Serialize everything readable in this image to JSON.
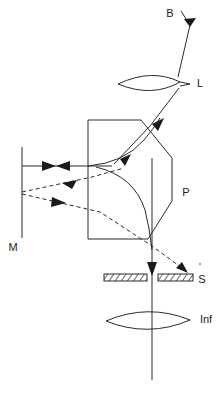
{
  "figure": {
    "type": "optical-ray-diagram",
    "background_color": "#ffffff",
    "line_color": "#2b2b2b",
    "label_color": "#1a1a1a",
    "width": 222,
    "height": 394
  },
  "labels": {
    "beam": "B",
    "lens": "L",
    "prism": "P",
    "mirror": "M",
    "slit": "S",
    "infinity_lens": "Inf"
  },
  "components": [
    {
      "id": "beam-source",
      "label": "B",
      "name": "incident-beam",
      "x": 170,
      "y": 14
    },
    {
      "id": "lens-l",
      "label": "L",
      "name": "collector-lens",
      "x": 200,
      "y": 84
    },
    {
      "id": "prism-p",
      "label": "P",
      "name": "prism",
      "x": 186,
      "y": 193
    },
    {
      "id": "mirror-m",
      "label": "M",
      "name": "mirror",
      "x": 12,
      "y": 248
    },
    {
      "id": "slit-s",
      "label": "S",
      "name": "slit",
      "x": 200,
      "y": 280
    },
    {
      "id": "lens-inf",
      "label": "Inf",
      "name": "infinity-lens",
      "x": 196,
      "y": 320
    }
  ],
  "geometry": {
    "beam_ray": {
      "points": "182,10 188,22 196,42",
      "description": "incident beam B entering from upper right"
    },
    "beam_to_lens": {
      "points": "188,22 176,78",
      "description": "beam segment down to lens L"
    },
    "lens_l": {
      "cx": 156,
      "cy": 82,
      "rx": 38,
      "ry": 13,
      "description": "biconvex lens L"
    },
    "lens_inf": {
      "cx": 148,
      "cy": 320,
      "rx": 42,
      "ry": 14,
      "description": "biconvex lens Inf"
    },
    "refracted_ray": {
      "points": "176,84 148,128 112,166",
      "description": "ray from lens L through prism face"
    },
    "prism_outline": {
      "points": "88,120 142,120 172,158 172,200 148,238 88,238",
      "description": "prism body polygon P"
    },
    "prism_arc_upper": {
      "path": "M 88,166 Q 128,164 160,118",
      "description": "upper curved surface inside prism"
    },
    "prism_arc_lower": {
      "path": "M 96,168 Q 142,184 146,246",
      "description": "lower curved surface inside prism"
    },
    "mirror_line": {
      "x": 22,
      "y1": 147,
      "y2": 238,
      "description": "plane mirror M"
    },
    "axis_ray": {
      "x": 22,
      "y": 166,
      "x2": 112,
      "y2": 166,
      "description": "horizontal solid ray between mirror M and prism with bidirectional arrowheads"
    },
    "dashed_ray_1": {
      "points": "22,192 118,170",
      "description": "dashed ray returning to mirror"
    },
    "dashed_ray_2": {
      "points": "22,196 186,272",
      "description": "dashed ray from mirror to slit S"
    },
    "vertical_ray": {
      "x": 152,
      "y1": 158,
      "y2": 380,
      "description": "vertical ray down through slit gap and Inf lens"
    },
    "slit_bar_left": {
      "x": 104,
      "y": 274,
      "w": 42,
      "h": 7,
      "description": "left slit jaw, hatched"
    },
    "slit_bar_right": {
      "x": 158,
      "y": 274,
      "w": 34,
      "h": 7,
      "description": "right slit jaw, hatched"
    }
  }
}
